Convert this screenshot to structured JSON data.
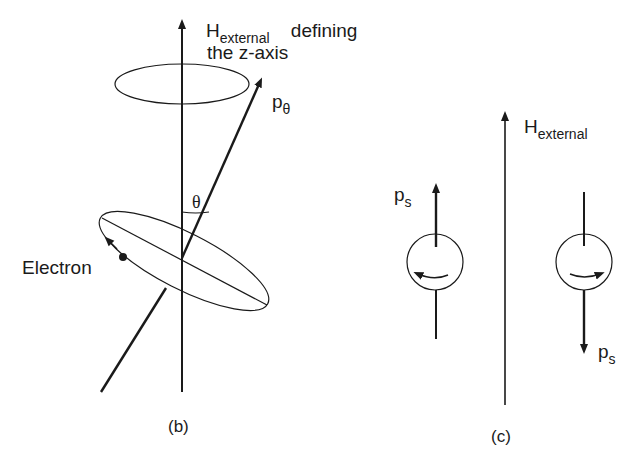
{
  "panel_b": {
    "axis_label_main": "H",
    "axis_label_sub": "external",
    "axis_label_rest": "defining",
    "axis_label_line2": "the z-axis",
    "vector_label_main": "p",
    "vector_label_sub": "θ",
    "angle_label": "θ",
    "electron_label": "Electron",
    "caption": "(b)"
  },
  "panel_c": {
    "axis_label_main": "H",
    "axis_label_sub": "external",
    "spin_up_label_main": "p",
    "spin_up_label_sub": "s",
    "spin_down_label_main": "p",
    "spin_down_label_sub": "s",
    "caption": "(c)"
  },
  "colors": {
    "line": "#1a1a1a",
    "background": "#ffffff"
  }
}
